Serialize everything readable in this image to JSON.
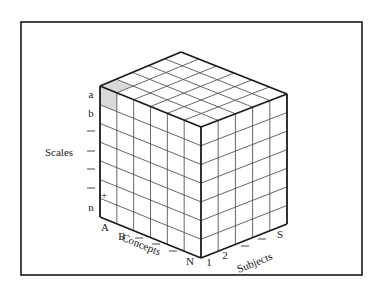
{
  "figure": {
    "frame": {
      "x": 21,
      "y": 22,
      "width": 341,
      "height": 253
    },
    "colors": {
      "line": "#1a1a1a",
      "grid": "#555555",
      "highlight": "#d9d9d9",
      "background": "#ffffff"
    },
    "cube": {
      "vertices": {
        "top_back": [
          181,
          52
        ],
        "left_top": [
          100,
          86
        ],
        "front_top": [
          201,
          127
        ],
        "right_top": [
          287,
          94
        ],
        "left_bottom": [
          100,
          217
        ],
        "front_bottom": [
          201,
          258
        ],
        "right_bottom": [
          287,
          224
        ]
      },
      "divisions": {
        "concepts": 6,
        "subjects": 5,
        "scales": 7
      },
      "highlighted_cell": {
        "concept": 0,
        "subject": 0,
        "scale": 0
      }
    },
    "axes": {
      "scales": {
        "title": "Scales",
        "title_pos": [
          47,
          156
        ],
        "ticks": [
          {
            "label": "a",
            "x": 91,
            "y": 98
          },
          {
            "label": "b",
            "x": 91,
            "y": 117
          },
          {
            "label": "—",
            "x": 91,
            "y": 134
          },
          {
            "label": "—",
            "x": 91,
            "y": 154
          },
          {
            "label": "—",
            "x": 91,
            "y": 172
          },
          {
            "label": "—",
            "x": 91,
            "y": 191
          },
          {
            "label": "n",
            "x": 91,
            "y": 211
          }
        ],
        "marker": {
          "symbol": "+",
          "x": 104,
          "y": 199
        }
      },
      "concepts": {
        "title": "Concepts",
        "title_pos": [
          120,
          248
        ],
        "title_rotation": 22,
        "ticks": [
          {
            "label": "A",
            "x": 105,
            "y": 231
          },
          {
            "label": "B",
            "x": 122,
            "y": 240
          },
          {
            "label": "—",
            "x": 139,
            "y": 241
          },
          {
            "label": "—",
            "x": 156,
            "y": 247
          },
          {
            "label": "—",
            "x": 173,
            "y": 254
          },
          {
            "label": "N",
            "x": 190,
            "y": 265
          }
        ]
      },
      "subjects": {
        "title": "Subjects",
        "title_pos": [
          242,
          270
        ],
        "title_rotation": -22,
        "ticks": [
          {
            "label": "1",
            "x": 209,
            "y": 266
          },
          {
            "label": "2",
            "x": 225,
            "y": 259
          },
          {
            "label": "—",
            "x": 245,
            "y": 249
          },
          {
            "label": "—",
            "x": 262,
            "y": 242
          },
          {
            "label": "S",
            "x": 280,
            "y": 238
          }
        ]
      }
    }
  }
}
